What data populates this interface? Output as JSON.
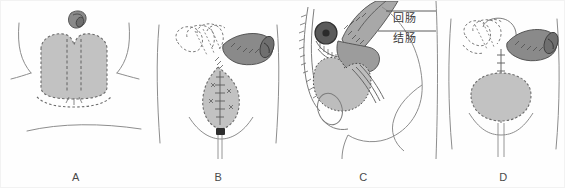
{
  "figure": {
    "title": "",
    "background": "#fefefe",
    "type": "medical-surgical-illustration",
    "technique": "grayscale line drawing with dashed suture lines",
    "panel_count": 4
  },
  "palette": {
    "ink": "#5a5a5a",
    "ink_dark": "#3a3a3a",
    "organ_light_fill": "#c2c2c2",
    "organ_mid_fill": "#a8a8a8",
    "bowel_dark_fill": "#8a8a8a",
    "bowel_darkest": "#555555",
    "dashed_outline": "#6b6b6b",
    "skin_outline": "#8d8d8d",
    "label_text": "#3a3a3a",
    "border": "#f2f2f2"
  },
  "panels": [
    {
      "id": "A",
      "letter": "A",
      "view": "anterior abdominal view",
      "description": "bivalved bladder with dashed midline incision lines and detached bowel segment above",
      "elements": [
        "abdominal-skin-contour",
        "left-flank-line",
        "right-flank-line",
        "lower-abdominal-crease",
        "bladder-dome-shaded",
        "dashed-bladder-outline",
        "midline-dashed-incision",
        "isolated-bowel-segment"
      ]
    },
    {
      "id": "B",
      "letter": "B",
      "view": "anterior abdominal view",
      "description": "reconfigured bowel segment anastomosed to reconstructed bladder with suture line and suprapubic catheter",
      "elements": [
        "torso-left-outline",
        "torso-right-outline",
        "small-bowel-loops-dashed",
        "isolated-bowel-segment-shaded",
        "mesentery-dashed-lines",
        "reconstructed-bladder-shaded",
        "suture-line",
        "stoma-marker",
        "pelvic-brim-curve",
        "catheter-tube"
      ]
    },
    {
      "id": "C",
      "letter": "C",
      "view": "lateral sagittal pelvic view",
      "description": "sagittal section showing ileal segment and colon with bladder pouch, sutured anastomosis and labeled bowel segments",
      "labels": [
        {
          "text": "回肠",
          "meaning": "ileum",
          "target": "ileal-segment"
        },
        {
          "text": "结肠",
          "meaning": "colon",
          "target": "colon-segment"
        }
      ],
      "elements": [
        "spine-vertebral-column",
        "sacral-outline",
        "ileal-segment-shaded",
        "colon-segment-shaded",
        "stoma-dark-disc",
        "bladder-pouch-shaded",
        "sutured-anastomosis",
        "buttock-contour",
        "thigh-contour",
        "urethra-outline",
        "leader-line-ileum",
        "leader-line-colon"
      ]
    },
    {
      "id": "D",
      "letter": "D",
      "view": "anterior abdominal view",
      "description": "completed reconstruction with bowel conduit joined to bladder by vertical suture line and indwelling catheter",
      "elements": [
        "torso-left-outline",
        "torso-right-outline",
        "small-bowel-loops-dashed",
        "bowel-conduit-shaded",
        "vertical-suture-line",
        "reconstructed-bladder-shaded",
        "dashed-bladder-outline",
        "pelvic-brim-curve",
        "catheter-tube"
      ]
    }
  ]
}
